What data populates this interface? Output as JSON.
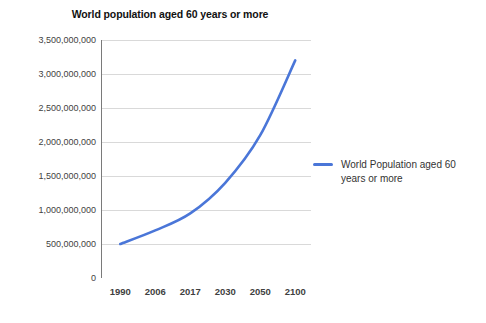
{
  "chart_data": {
    "type": "line",
    "title": "World population aged 60 years or more",
    "xlabel": "",
    "ylabel": "",
    "categories": [
      "1990",
      "2006",
      "2017",
      "2030",
      "2050",
      "2100"
    ],
    "series": [
      {
        "name": "World Population aged 60 years or more",
        "values": [
          500000000,
          700000000,
          950000000,
          1400000000,
          2100000000,
          3200000000
        ],
        "color": "#4a76d8"
      }
    ],
    "ylim": [
      0,
      3500000000
    ],
    "yticks": [
      0,
      500000000,
      1000000000,
      1500000000,
      2000000000,
      2500000000,
      3000000000,
      3500000000
    ],
    "ytick_labels": [
      "0",
      "500,000,000",
      "1,000,000,000",
      "1,500,000,000",
      "2,000,000,000",
      "2,500,000,000",
      "3,000,000,000",
      "3,500,000,000"
    ],
    "xtick_labels": [
      "1990",
      "2006",
      "2017",
      "2030",
      "2050",
      "2100"
    ],
    "grid": true,
    "grid_axis": "y",
    "legend_position": "right",
    "legend_entries": [
      "World Population aged 60 years or more"
    ],
    "colors": {
      "line": "#4a76d8",
      "grid": "#d9d9d9",
      "axis": "#7a7a7a",
      "tick_text": "#3f3f3f",
      "title_text": "#111111",
      "background": "#ffffff"
    }
  }
}
